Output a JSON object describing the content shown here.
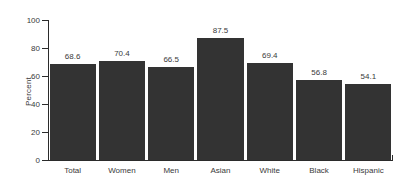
{
  "chart_data": {
    "type": "bar",
    "title": "",
    "subtitle": "",
    "xlabel": "",
    "ylabel": "Percent",
    "categories": [
      "Total",
      "Women",
      "Men",
      "Asian",
      "White",
      "Black",
      "Hispanic"
    ],
    "values": [
      68.6,
      70.4,
      66.5,
      87.5,
      69.4,
      56.8,
      54.1
    ],
    "value_labels": [
      "68.6",
      "70.4",
      "66.5",
      "87.5",
      "69.4",
      "56.8",
      "54.1"
    ],
    "ylim": [
      0,
      100
    ],
    "ytick_labels": [
      "0",
      "20",
      "40",
      "60",
      "80",
      "100"
    ],
    "ytick_values": [
      0,
      20,
      40,
      60,
      80,
      100
    ],
    "grid": false,
    "legend": false,
    "legend_position": "none",
    "bar_color": "#333333",
    "axis_color": "#2b2b2b",
    "text_color": "#3a3a3a",
    "background_color": "#ffffff"
  }
}
